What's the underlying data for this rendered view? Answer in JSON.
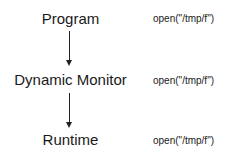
{
  "diagram": {
    "nodes": [
      {
        "label": "Program",
        "call": "open(\"/tmp/f\")"
      },
      {
        "label": "Dynamic Monitor",
        "call": "open(\"/tmp/f\")"
      },
      {
        "label": "Runtime",
        "call": "open(\"/tmp/f\")"
      }
    ],
    "edges": [
      {
        "from": "Program",
        "to": "Dynamic Monitor"
      },
      {
        "from": "Dynamic Monitor",
        "to": "Runtime"
      }
    ]
  }
}
